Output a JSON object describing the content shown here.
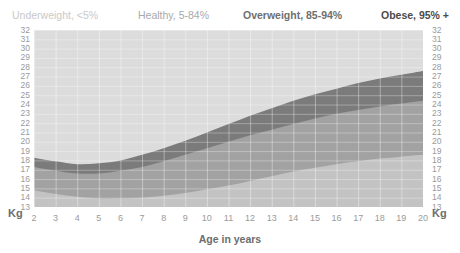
{
  "legend": {
    "items": [
      {
        "label": "Underweight, <5%",
        "color": "#c9c9c9",
        "band_color": "#dcdcdc"
      },
      {
        "label": "Healthy, 5-84%",
        "color": "#a9a9a9",
        "band_color": "#c3c3c3"
      },
      {
        "label": "Overweight, 85-94%",
        "color": "#6f6f6f",
        "band_color": "#a2a2a2"
      },
      {
        "label": "Obese, 95% +",
        "color": "#4b4b4b",
        "band_color": "#7b7b7b"
      }
    ]
  },
  "axes": {
    "y_unit_label": "Kg",
    "y_ticks": [
      "32",
      "31",
      "30",
      "29",
      "28",
      "27",
      "26",
      "25",
      "24",
      "23",
      "22",
      "21",
      "20",
      "19",
      "18",
      "17",
      "16",
      "15",
      "14",
      "13"
    ],
    "x_title": "Age in years",
    "x_ticks": [
      "2",
      "3",
      "4",
      "5",
      "6",
      "7",
      "8",
      "9",
      "10",
      "11",
      "12",
      "13",
      "14",
      "15",
      "16",
      "17",
      "18",
      "19",
      "20"
    ]
  },
  "chart_data": {
    "type": "area",
    "title": "",
    "xlabel": "Age in years",
    "ylabel": "Kg",
    "xlim": [
      2,
      20
    ],
    "ylim": [
      13,
      32
    ],
    "grid": true,
    "legend_position": "top",
    "x": [
      2,
      3,
      4,
      5,
      6,
      7,
      8,
      9,
      10,
      11,
      12,
      13,
      14,
      15,
      16,
      17,
      18,
      19,
      20
    ],
    "series": [
      {
        "name": "Obese, 95% +",
        "description": "Lower boundary of the obese band (95th percentile BMI)",
        "color": "#7b7b7b",
        "values": [
          18.3,
          17.9,
          17.6,
          17.7,
          18.0,
          18.6,
          19.3,
          20.1,
          21.0,
          21.9,
          22.8,
          23.6,
          24.4,
          25.1,
          25.7,
          26.3,
          26.8,
          27.2,
          27.6
        ]
      },
      {
        "name": "Overweight, 85-94%",
        "description": "Lower boundary of the overweight band (85th percentile BMI)",
        "color": "#a2a2a2",
        "values": [
          17.3,
          16.9,
          16.6,
          16.6,
          16.9,
          17.3,
          17.9,
          18.6,
          19.3,
          20.0,
          20.7,
          21.3,
          21.9,
          22.5,
          23.0,
          23.4,
          23.8,
          24.1,
          24.4
        ]
      },
      {
        "name": "Healthy, 5-84%",
        "description": "Lower boundary of the healthy band (5th percentile BMI)",
        "color": "#c3c3c3",
        "values": [
          14.8,
          14.4,
          14.1,
          13.9,
          13.9,
          14.0,
          14.2,
          14.5,
          14.9,
          15.3,
          15.8,
          16.3,
          16.8,
          17.2,
          17.6,
          17.9,
          18.2,
          18.4,
          18.6
        ]
      },
      {
        "name": "Underweight, <5%",
        "description": "Region below the 5th percentile, extends to bottom of axis",
        "color": "#dcdcdc",
        "values": [
          13,
          13,
          13,
          13,
          13,
          13,
          13,
          13,
          13,
          13,
          13,
          13,
          13,
          13,
          13,
          13,
          13,
          13,
          13
        ]
      }
    ]
  }
}
